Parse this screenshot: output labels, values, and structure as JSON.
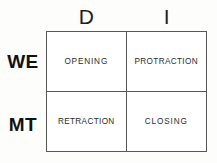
{
  "diagram": {
    "type": "2x2-matrix",
    "column_headers": [
      {
        "id": "d",
        "label": "D"
      },
      {
        "id": "i",
        "label": "I"
      }
    ],
    "row_labels": [
      {
        "id": "we",
        "label": "WE"
      },
      {
        "id": "mt",
        "label": "MT"
      }
    ],
    "cells": [
      {
        "id": "we-d",
        "label": "OPENING"
      },
      {
        "id": "we-i",
        "label": "PROTRACTION"
      },
      {
        "id": "mt-d",
        "label": "RETRACTION"
      },
      {
        "id": "mt-i",
        "label": "CLOSING"
      }
    ],
    "colors": {
      "border": "#585858",
      "background": "#fdfdfb",
      "cell_background": "#ffffff",
      "header_text": "#1d1d1d",
      "row_label_text": "#111111",
      "cell_text": "#2b2b2b"
    }
  }
}
